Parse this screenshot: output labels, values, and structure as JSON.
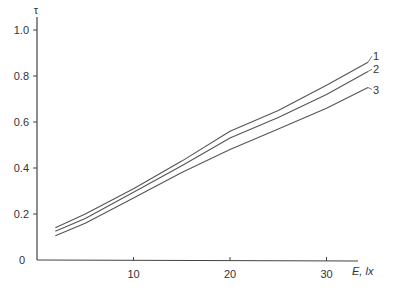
{
  "chart_data": {
    "type": "line",
    "title": "",
    "xlabel": "E, lx",
    "ylabel": "τ",
    "xlim": [
      0,
      35
    ],
    "ylim": [
      0,
      1.05
    ],
    "x_ticks": [
      10,
      20,
      30
    ],
    "y_ticks": [
      0,
      0.2,
      0.4,
      0.6,
      0.8,
      1.0
    ],
    "y_tick_labels": [
      "0",
      "0.2",
      "0.4",
      "0.6",
      "0.8",
      "1.0"
    ],
    "x_tick_labels": [
      "10",
      "20",
      "30"
    ],
    "grid": false,
    "legend": "inline labels at right end of curves",
    "series": [
      {
        "name": "1",
        "x": [
          1.9,
          5,
          10,
          15,
          20,
          25,
          30,
          34.3
        ],
        "values": [
          0.14,
          0.2,
          0.31,
          0.43,
          0.56,
          0.65,
          0.76,
          0.86
        ]
      },
      {
        "name": "2",
        "x": [
          1.9,
          5,
          10,
          15,
          20,
          25,
          30,
          34.3
        ],
        "values": [
          0.125,
          0.18,
          0.295,
          0.41,
          0.53,
          0.62,
          0.72,
          0.82
        ]
      },
      {
        "name": "3",
        "x": [
          1.9,
          5,
          10,
          15,
          20,
          25,
          30,
          34.3
        ],
        "values": [
          0.105,
          0.16,
          0.27,
          0.38,
          0.48,
          0.57,
          0.66,
          0.75
        ]
      }
    ]
  },
  "colors": {
    "axis": "#444444",
    "line": "#555555",
    "text": "#333333"
  }
}
